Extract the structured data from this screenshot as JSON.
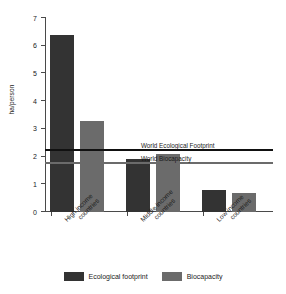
{
  "chart_data": {
    "type": "bar",
    "title": "",
    "subtitle": "",
    "xlabel": "",
    "ylabel": "ha/person",
    "ylim": [
      0,
      7
    ],
    "ytick_labels": [
      "0",
      "1",
      "2",
      "3",
      "4",
      "5",
      "6",
      "7"
    ],
    "ytick_values": [
      0,
      1,
      2,
      3,
      4,
      5,
      6,
      7
    ],
    "grid": false,
    "legend_position": "bottom",
    "categories": [
      "High income countries",
      "Middle income countries",
      "Low income countries"
    ],
    "category_lines": [
      [
        "High income",
        "countries"
      ],
      [
        "Middle income",
        "countries"
      ],
      [
        "Low income",
        "countries"
      ]
    ],
    "series": [
      {
        "name": "Ecological footprint",
        "color": "#333333",
        "values": [
          6.4,
          1.9,
          0.8
        ]
      },
      {
        "name": "Biocapacity",
        "color": "#6b6b6b",
        "values": [
          3.3,
          2.1,
          0.7
        ]
      }
    ],
    "reference_lines": [
      {
        "label": "World Ecological Footprint",
        "value": 2.2,
        "color": "#111111"
      },
      {
        "label": "World Biocapacity",
        "value": 1.75,
        "color": "#6b6b6b"
      }
    ]
  },
  "legend": {
    "items": [
      {
        "label": "Ecological footprint",
        "color": "#333333"
      },
      {
        "label": "Biocapacity",
        "color": "#6b6b6b"
      }
    ]
  }
}
